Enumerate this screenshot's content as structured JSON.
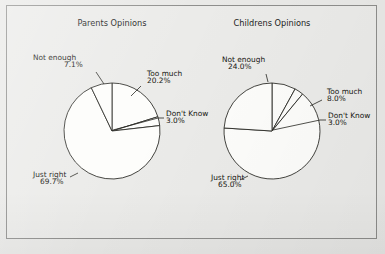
{
  "figure": {
    "background_color": "#e9e9e7",
    "frame_color": "#8e8e8c",
    "slice_fill": "#fdfdfb",
    "slice_stroke": "#24241f",
    "caption_partial": ""
  },
  "chart_data": [
    {
      "type": "pie",
      "title": "Parents Opinions",
      "center": [
        112,
        131
      ],
      "radius": 48,
      "start_angle_deg": -90,
      "direction": "clockwise",
      "categories": [
        "Too much",
        "Don't Know",
        "Just right",
        "Not enough"
      ],
      "values": [
        20.2,
        3.0,
        69.7,
        7.1
      ],
      "labels": [
        {
          "name": "Too much",
          "pct": "20.2%",
          "value": 20.2,
          "name_x": 147,
          "name_y": 76,
          "pct_x": 147,
          "pct_y": 83,
          "anchor": "start",
          "leader": [
            [
              141,
              86
            ],
            [
              131,
              96
            ]
          ]
        },
        {
          "name": "Don't Know",
          "pct": "3.0%",
          "value": 3.0,
          "name_x": 166,
          "name_y": 116,
          "pct_x": 166,
          "pct_y": 123,
          "anchor": "start",
          "leader": [
            [
              164,
              118
            ],
            [
              158,
              118
            ],
            [
              113,
              130
            ]
          ]
        },
        {
          "name": "Just right",
          "pct": "69.7%",
          "value": 69.7,
          "name_x": 33,
          "name_y": 177,
          "pct_x": 40,
          "pct_y": 184,
          "anchor": "start",
          "leader": [
            [
              78,
              173
            ],
            [
              70,
              177
            ]
          ]
        },
        {
          "name": "Not enough",
          "pct": "7.1%",
          "value": 7.1,
          "name_x": 33,
          "name_y": 60,
          "pct_x": 64,
          "pct_y": 67,
          "anchor": "start",
          "leader": [
            [
              96,
              72
            ],
            [
              104,
              84
            ]
          ]
        }
      ]
    },
    {
      "type": "pie",
      "title": "Childrens Opinions",
      "center": [
        272,
        131
      ],
      "radius": 48,
      "start_angle_deg": -90,
      "direction": "clockwise",
      "categories": [
        "Too much",
        "Don't Know",
        "Just right",
        "Not enough"
      ],
      "values": [
        8.0,
        3.0,
        65.0,
        24.0
      ],
      "labels": [
        {
          "name": "Too much",
          "pct": "8.0%",
          "value": 8.0,
          "name_x": 327,
          "name_y": 94,
          "pct_x": 327,
          "pct_y": 101,
          "anchor": "start",
          "leader": [
            [
              322,
              100
            ],
            [
              310,
              106
            ]
          ]
        },
        {
          "name": "Don't Know",
          "pct": "3.0%",
          "value": 3.0,
          "name_x": 328,
          "name_y": 118,
          "pct_x": 328,
          "pct_y": 125,
          "anchor": "start",
          "leader": [
            [
              326,
              120
            ],
            [
              320,
              120
            ],
            [
              273,
              130
            ]
          ]
        },
        {
          "name": "Just right",
          "pct": "65.0%",
          "value": 65.0,
          "name_x": 211,
          "name_y": 180,
          "pct_x": 218,
          "pct_y": 187,
          "anchor": "start",
          "leader": [
            [
              248,
              176
            ],
            [
              240,
              180
            ]
          ]
        },
        {
          "name": "Not enough",
          "pct": "24.0%",
          "value": 24.0,
          "name_x": 222,
          "name_y": 62,
          "pct_x": 228,
          "pct_y": 69,
          "anchor": "start",
          "leader": [
            [
              266,
              74
            ],
            [
              268,
              82
            ]
          ]
        }
      ]
    }
  ]
}
